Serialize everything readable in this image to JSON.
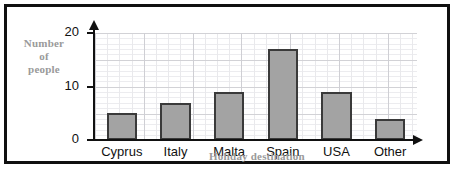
{
  "chart_data": {
    "type": "bar",
    "title": "",
    "categories": [
      "Cyprus",
      "Italy",
      "Malta",
      "Spain",
      "USA",
      "Other"
    ],
    "values": [
      5,
      7,
      9,
      17,
      9,
      4
    ],
    "xlabel": "Holiday destination",
    "ylabel": "Number of people",
    "ylabel_lines": [
      "Number",
      "of",
      "people"
    ],
    "ylim": [
      0,
      20
    ],
    "y_ticks": [
      0,
      10,
      20
    ],
    "y_tick_labels": [
      "0",
      "10",
      "20"
    ],
    "y_major_step": 5,
    "y_minor_step": 1,
    "grid": true,
    "legend": null,
    "axis_arrows": true,
    "colors": {
      "bar_fill": "#a3a3a3",
      "bar_stroke": "#3a3a3a",
      "axis": "#111111",
      "grid_major": "#d2d2d6",
      "grid_minor": "#ececef",
      "axis_title": "#9a9a9a",
      "tick_label": "#111111",
      "frame": "#101010",
      "background": "#ffffff"
    }
  }
}
